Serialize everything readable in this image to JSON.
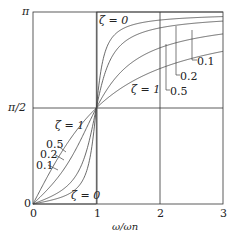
{
  "chart_data": {
    "type": "line",
    "title": "",
    "xlabel": "ω/ω_n",
    "ylabel": "",
    "xlim": [
      0,
      3
    ],
    "ylim": [
      0,
      3.14159
    ],
    "x_ticks": [
      "0",
      "1",
      "2",
      "3"
    ],
    "y_ticks": [
      "0",
      "π/2",
      "π"
    ],
    "grid": true,
    "formula": "phase = atan2(2ζr, 1 − r²)",
    "series": [
      {
        "name": "ζ = 0",
        "zeta": 0
      },
      {
        "name": "0.1",
        "zeta": 0.1
      },
      {
        "name": "0.2",
        "zeta": 0.2
      },
      {
        "name": "0.5",
        "zeta": 0.5
      },
      {
        "name": "ζ = 1",
        "zeta": 1
      }
    ],
    "sample_values": {
      "r": [
        0,
        0.5,
        1,
        1.5,
        2,
        3
      ],
      "zeta_0.1": [
        0,
        0.13,
        1.571,
        2.95,
        3.01,
        3.07
      ],
      "zeta_0.2": [
        0,
        0.26,
        1.571,
        2.83,
        2.88,
        2.99
      ],
      "zeta_0.5": [
        0,
        0.59,
        1.571,
        2.27,
        2.55,
        2.78
      ],
      "zeta_1": [
        0,
        0.93,
        1.571,
        2.18,
        2.5,
        2.5
      ]
    }
  },
  "labels": {
    "y_pi": "π",
    "y_half_pi": "π/2",
    "y_zero": "0",
    "x_0": "0",
    "x_1": "1",
    "x_2": "2",
    "x_3": "3",
    "xlabel": "ω/ωn",
    "zeta0_top": "ζ = 0",
    "zeta0_bottom": "ζ = 0",
    "zeta1_right": "ζ = 1",
    "zeta1_left": "ζ = 1",
    "right_01": "0.1",
    "right_02": "0.2",
    "right_05": "0.5",
    "left_05": "0.5",
    "left_02": "0.2",
    "left_01": "0.1"
  }
}
